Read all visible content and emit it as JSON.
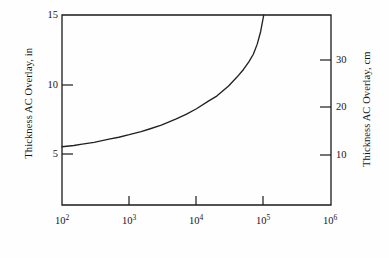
{
  "figure": {
    "background_color": "#fefefe",
    "line_color": "#222222",
    "axis_color": "#1a1a1a"
  },
  "axes": {
    "left": {
      "title": "Thickness AC Overlay, in",
      "ticks": [
        "5",
        "10",
        "15"
      ],
      "min": 0,
      "max": 15
    },
    "right": {
      "title": "Thickness AC Overlay, cm",
      "ticks": [
        "10",
        "20",
        "30"
      ],
      "min": 0,
      "max": 38.1
    },
    "bottom": {
      "title": "",
      "ticks": [
        {
          "mantissa": "10",
          "exponent": "2"
        },
        {
          "mantissa": "10",
          "exponent": "3"
        },
        {
          "mantissa": "10",
          "exponent": "4"
        },
        {
          "mantissa": "10",
          "exponent": "5"
        },
        {
          "mantissa": "10",
          "exponent": "6"
        }
      ]
    }
  },
  "chart_data": {
    "type": "line",
    "title": "",
    "xlabel": "",
    "ylabel": "Thickness AC Overlay, in",
    "ylabel_secondary": "Thickness AC Overlay, cm",
    "xscale": "log",
    "yscale": "linear",
    "xlim": [
      100,
      1000000
    ],
    "ylim": [
      0,
      15
    ],
    "ylim_secondary": [
      0,
      38.1
    ],
    "xticks": [
      100,
      1000,
      10000,
      100000,
      1000000
    ],
    "xticklabels": [
      "10^2",
      "10^3",
      "10^4",
      "10^5",
      "10^6"
    ],
    "yticks": [
      5,
      10,
      15
    ],
    "yticklabels": [
      "5",
      "10",
      "15"
    ],
    "yticks_secondary": [
      10,
      20,
      30
    ],
    "yticklabels_secondary": [
      "10",
      "20",
      "30"
    ],
    "grid": false,
    "legend": null,
    "series": [
      {
        "name": "AC overlay thickness",
        "x": [
          100,
          150,
          200,
          300,
          500,
          700,
          1000,
          1500,
          2000,
          3000,
          5000,
          7000,
          10000,
          15000,
          20000,
          30000,
          40000,
          50000,
          60000,
          70000,
          80000,
          90000,
          100000
        ],
        "y": [
          4.6,
          4.7,
          4.8,
          4.95,
          5.2,
          5.35,
          5.55,
          5.8,
          6.0,
          6.3,
          6.8,
          7.15,
          7.6,
          8.2,
          8.6,
          9.4,
          10.1,
          10.7,
          11.3,
          11.9,
          12.7,
          13.7,
          15.0
        ]
      }
    ]
  }
}
